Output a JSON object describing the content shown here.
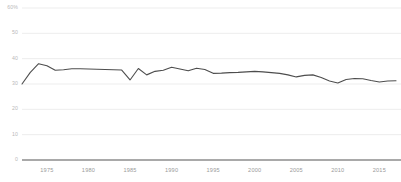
{
  "chart_data": {
    "type": "line",
    "title": "",
    "subtitle": "",
    "xlabel": "",
    "ylabel": "",
    "xlim": [
      1972,
      2017
    ],
    "ylim": [
      0,
      60
    ],
    "grid": true,
    "legend": "none",
    "y_ticks": [
      0,
      10,
      20,
      30,
      40,
      50,
      60
    ],
    "y_tick_labels": [
      "0",
      "10",
      "20",
      "30",
      "40",
      "50",
      "60%"
    ],
    "x_ticks": [
      1975,
      1980,
      1985,
      1990,
      1995,
      2000,
      2005,
      2010,
      2015
    ],
    "x_tick_labels": [
      "1975",
      "1980",
      "1985",
      "1990",
      "1995",
      "2000",
      "2005",
      "2010",
      "2015"
    ],
    "line_color": "#4d4d4d",
    "grid_color": "#ededed",
    "axis_color": "#555555",
    "series": [
      {
        "name": "series-1",
        "x": [
          1972,
          1973,
          1974,
          1975,
          1976,
          1977,
          1978,
          1979,
          1980,
          1981,
          1982,
          1983,
          1984,
          1985,
          1986,
          1987,
          1988,
          1989,
          1990,
          1991,
          1992,
          1993,
          1994,
          1995,
          1996,
          1997,
          1998,
          1999,
          2000,
          2001,
          2002,
          2003,
          2004,
          2005,
          2006,
          2007,
          2008,
          2009,
          2010,
          2011,
          2012,
          2013,
          2014,
          2015,
          2016,
          2017
        ],
        "values": [
          30.0,
          34.6,
          38.0,
          37.2,
          35.4,
          35.6,
          36.0,
          36.0,
          35.9,
          35.8,
          35.7,
          35.6,
          35.5,
          31.6,
          36.1,
          33.6,
          35.0,
          35.4,
          36.6,
          35.9,
          35.2,
          36.2,
          35.7,
          34.2,
          34.3,
          34.5,
          34.6,
          34.8,
          35.0,
          34.8,
          34.5,
          34.2,
          33.6,
          32.8,
          33.4,
          33.6,
          32.6,
          31.2,
          30.4,
          31.8,
          32.2,
          32.1,
          31.4,
          30.8,
          31.2,
          31.3
        ]
      }
    ]
  }
}
